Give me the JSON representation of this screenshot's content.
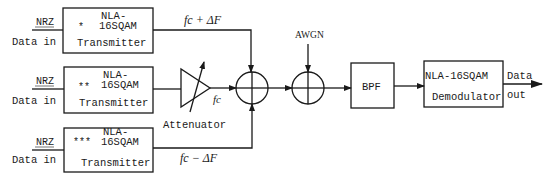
{
  "diagram": {
    "type": "block-diagram",
    "inputs": [
      {
        "id": "in1",
        "signal_label": "NRZ",
        "data_label": "Data in"
      },
      {
        "id": "in2",
        "signal_label": "NRZ",
        "data_label": "Data in"
      },
      {
        "id": "in3",
        "signal_label": "NRZ",
        "data_label": "Data in"
      }
    ],
    "transmitters": [
      {
        "id": "tx1",
        "marker": "*",
        "line1": "NLA-",
        "line2": "16SQAM",
        "line3": "Transmitter"
      },
      {
        "id": "tx2",
        "marker": "**",
        "line1": "NLA-",
        "line2": "16SQAM",
        "line3": "Transmitter"
      },
      {
        "id": "tx3",
        "marker": "***",
        "line1": "NLA-",
        "line2": "16SQAM",
        "line3": "Transmitter"
      }
    ],
    "frequency_labels": {
      "upper": "fc + ΔF",
      "middle": "fc",
      "lower": "fc − ΔF"
    },
    "attenuator": {
      "label": "Attenuator"
    },
    "noise": {
      "label": "AWGN"
    },
    "filter": {
      "label": "BPF"
    },
    "demodulator": {
      "line1": "NLA-16SQAM",
      "line2": "Demodulator"
    },
    "output": {
      "line1": "Data",
      "line2": "out"
    },
    "colors": {
      "stroke": "#1a1a1a",
      "background": "#ffffff"
    }
  }
}
